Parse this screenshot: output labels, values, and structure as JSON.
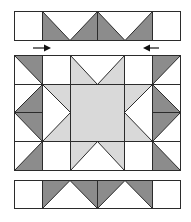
{
  "title": "Quilt block assembly diagram",
  "colors": {
    "background": "#ffffff",
    "dark": "#8c8c8c",
    "light": "#d9d9d9",
    "white": "#ffffff",
    "outline": "#2b2b2b",
    "arrow": "#111111"
  },
  "top_strip": {
    "label": "top border strip",
    "bounds": {
      "x": 14,
      "y": 11,
      "w": 166,
      "h": 29
    },
    "cells": [
      {
        "type": "plain-square",
        "fill": "white"
      },
      {
        "type": "flying-geese-pair",
        "fill": "dark",
        "point": "down"
      },
      {
        "type": "flying-geese-pair",
        "fill": "dark",
        "point": "down"
      },
      {
        "type": "plain-square",
        "fill": "white"
      }
    ]
  },
  "arrows": [
    {
      "direction": "right",
      "x1": 33,
      "x2": 50,
      "y": 48,
      "icon": "arrow-right-icon"
    },
    {
      "direction": "left",
      "x1": 159,
      "x2": 144,
      "y": 48,
      "icon": "arrow-left-icon"
    }
  ],
  "main_block": {
    "label": "center star block",
    "bounds": {
      "x": 14,
      "y": 55,
      "w": 166,
      "h": 115
    },
    "columns": [
      14,
      42,
      70,
      124,
      152,
      180
    ],
    "rows": [
      55,
      84,
      112,
      141,
      170
    ],
    "center": {
      "fill": "light",
      "label": "center square"
    }
  },
  "bottom_strip": {
    "label": "bottom border strip",
    "bounds": {
      "x": 14,
      "y": 180,
      "w": 166,
      "h": 28
    },
    "cells": [
      {
        "type": "plain-square",
        "fill": "white"
      },
      {
        "type": "flying-geese-pair",
        "fill": "dark",
        "point": "up"
      },
      {
        "type": "flying-geese-pair",
        "fill": "dark",
        "point": "up"
      },
      {
        "type": "plain-square",
        "fill": "white"
      }
    ]
  }
}
